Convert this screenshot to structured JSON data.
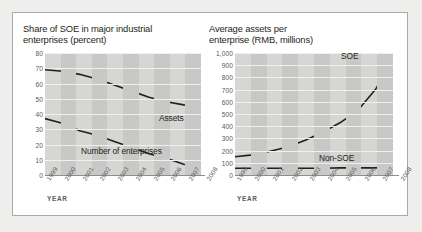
{
  "figure": {
    "background_color": "#eeeeec",
    "panel_color": "#ffffff",
    "border_color": "#a9a9a9"
  },
  "charts": [
    {
      "id": "share-of-soe",
      "title": "Share of SOE in major industrial\nenterprises (percent)",
      "axis_name": "YEAR"
    },
    {
      "id": "average-assets",
      "title": "Average assets per\nenterprise (RMB, millions)",
      "axis_name": "YEAR"
    }
  ],
  "chart_data": [
    {
      "type": "line",
      "id": "share-of-soe",
      "title": "Share of SOE in major industrial enterprises (percent)",
      "xlabel": "YEAR",
      "ylabel": "",
      "categories": [
        "1999",
        "2000",
        "2001",
        "2002",
        "2003",
        "2004",
        "2005",
        "2006",
        "2007",
        "2008"
      ],
      "ylim": [
        0,
        80
      ],
      "yticks": [
        0,
        10,
        20,
        30,
        40,
        50,
        60,
        70,
        80
      ],
      "ytick_labels": [
        "0",
        "10",
        "20",
        "30",
        "40",
        "50",
        "60",
        "70",
        "80"
      ],
      "grid": true,
      "legend": "inline-labels",
      "series": [
        {
          "name": "Assets",
          "color": "#231f20",
          "values": [
            69,
            68,
            66,
            63,
            59,
            55,
            51,
            48,
            46,
            45
          ]
        },
        {
          "name": "Number of enterprises",
          "color": "#231f20",
          "values": [
            37,
            34,
            29,
            26,
            22,
            18,
            14,
            11,
            7,
            5
          ]
        }
      ]
    },
    {
      "type": "line",
      "id": "average-assets",
      "title": "Average assets per enterprise (RMB, millions)",
      "xlabel": "YEAR",
      "ylabel": "",
      "categories": [
        "1999",
        "2000",
        "2001",
        "2002",
        "2003",
        "2004",
        "2005",
        "2006",
        "2007",
        "2008"
      ],
      "ylim": [
        0,
        1000
      ],
      "yticks": [
        0,
        100,
        200,
        300,
        400,
        500,
        600,
        700,
        800,
        900,
        1000
      ],
      "ytick_labels": [
        "0",
        "100",
        "200",
        "300",
        "400",
        "500",
        "600",
        "700",
        "800",
        "900",
        "1,000"
      ],
      "grid": true,
      "legend": "inline-labels",
      "series": [
        {
          "name": "SOE",
          "color": "#231f20",
          "values": [
            150,
            165,
            195,
            230,
            285,
            350,
            430,
            530,
            700,
            950
          ]
        },
        {
          "name": "Non-SOE",
          "color": "#231f20",
          "values": [
            55,
            55,
            55,
            55,
            55,
            55,
            58,
            58,
            58,
            58
          ]
        }
      ]
    }
  ]
}
